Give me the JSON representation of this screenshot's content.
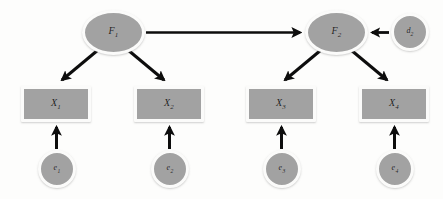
{
  "diagram": {
    "type": "path-diagram",
    "background_color": "#fdfdfc",
    "node_fill_color": "#a2a2a2",
    "node_border_color": "#fbfbfa",
    "arrow_color": "#0d0d0d",
    "nodes": [
      {
        "id": "F1",
        "label": "F",
        "subscript": "1",
        "shape": "ellipse",
        "role": "latent-factor",
        "x": 82,
        "y": 10,
        "w": 63,
        "h": 45
      },
      {
        "id": "F2",
        "label": "F",
        "subscript": "2",
        "shape": "ellipse",
        "role": "latent-factor",
        "x": 305,
        "y": 10,
        "w": 63,
        "h": 45
      },
      {
        "id": "d2",
        "label": "d",
        "subscript": "2",
        "shape": "circle",
        "role": "disturbance",
        "x": 391,
        "y": 13,
        "w": 38,
        "h": 38
      },
      {
        "id": "X1",
        "label": "X",
        "subscript": "1",
        "shape": "rectangle",
        "role": "observed-variable",
        "x": 21,
        "y": 86,
        "w": 70,
        "h": 36
      },
      {
        "id": "X2",
        "label": "X",
        "subscript": "2",
        "shape": "rectangle",
        "role": "observed-variable",
        "x": 134,
        "y": 86,
        "w": 70,
        "h": 36
      },
      {
        "id": "X3",
        "label": "X",
        "subscript": "3",
        "shape": "rectangle",
        "role": "observed-variable",
        "x": 246,
        "y": 86,
        "w": 70,
        "h": 36
      },
      {
        "id": "X4",
        "label": "X",
        "subscript": "4",
        "shape": "rectangle",
        "role": "observed-variable",
        "x": 359,
        "y": 86,
        "w": 70,
        "h": 36
      },
      {
        "id": "e1",
        "label": "e",
        "subscript": "1",
        "shape": "circle",
        "role": "error-term",
        "x": 38,
        "y": 150,
        "w": 38,
        "h": 38
      },
      {
        "id": "e2",
        "label": "e",
        "subscript": "2",
        "shape": "circle",
        "role": "error-term",
        "x": 151,
        "y": 150,
        "w": 38,
        "h": 38
      },
      {
        "id": "e3",
        "label": "e",
        "subscript": "3",
        "shape": "circle",
        "role": "error-term",
        "x": 263,
        "y": 150,
        "w": 38,
        "h": 38
      },
      {
        "id": "e4",
        "label": "e",
        "subscript": "4",
        "shape": "circle",
        "role": "error-term",
        "x": 376,
        "y": 150,
        "w": 38,
        "h": 38
      }
    ],
    "edges": [
      {
        "id": "F1-F2",
        "from": "F1",
        "to": "F2",
        "kind": "structural-path",
        "direction": "right"
      },
      {
        "id": "F1-X1",
        "from": "F1",
        "to": "X1",
        "kind": "loading-path",
        "direction": "down-left"
      },
      {
        "id": "F1-X2",
        "from": "F1",
        "to": "X2",
        "kind": "loading-path",
        "direction": "down-right"
      },
      {
        "id": "F2-X3",
        "from": "F2",
        "to": "X3",
        "kind": "loading-path",
        "direction": "down-left"
      },
      {
        "id": "F2-X4",
        "from": "F2",
        "to": "X4",
        "kind": "loading-path",
        "direction": "down-right"
      },
      {
        "id": "d2-F2",
        "from": "d2",
        "to": "F2",
        "kind": "disturbance-path",
        "direction": "left"
      },
      {
        "id": "e1-X1",
        "from": "e1",
        "to": "X1",
        "kind": "error-path",
        "direction": "up"
      },
      {
        "id": "e2-X2",
        "from": "e2",
        "to": "X2",
        "kind": "error-path",
        "direction": "up"
      },
      {
        "id": "e3-X3",
        "from": "e3",
        "to": "X3",
        "kind": "error-path",
        "direction": "up"
      },
      {
        "id": "e4-X4",
        "from": "e4",
        "to": "X4",
        "kind": "error-path",
        "direction": "up"
      }
    ]
  }
}
